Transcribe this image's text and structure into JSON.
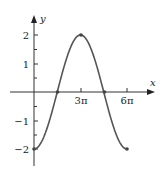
{
  "chart_data": {
    "type": "line",
    "title": "",
    "xlabel": "x",
    "ylabel": "y",
    "function": "y = -2cos(x/3)",
    "xlim": [
      0,
      6.2832
    ],
    "ylim": [
      -2,
      2
    ],
    "x_ticks": [
      {
        "value": 3,
        "label": "3π"
      },
      {
        "value": 6,
        "label": "6π"
      }
    ],
    "x_ticks_units": "multiples of π",
    "y_ticks": [
      {
        "value": 2,
        "label": "2"
      },
      {
        "value": 1,
        "label": "1"
      },
      {
        "value": -1,
        "label": "-1"
      },
      {
        "value": -2,
        "label": "-2"
      }
    ],
    "y_minor_ticks": [
      1.5,
      0.5,
      -0.5,
      -1.5
    ],
    "points": [
      {
        "x": "0",
        "y": -2
      },
      {
        "x": "3π/2",
        "y": 0
      },
      {
        "x": "3π",
        "y": 2
      },
      {
        "x": "9π/2",
        "y": 0
      },
      {
        "x": "6π",
        "y": -2
      }
    ],
    "series": [
      {
        "name": "y = -2cos(x/3)",
        "x_in_pi": [
          0,
          0.5,
          1,
          1.5,
          2,
          2.5,
          3,
          3.5,
          4,
          4.5,
          5,
          5.5,
          6
        ],
        "values": [
          -2,
          -1.932,
          -1.732,
          -1.414,
          -1,
          -0.518,
          0,
          0.518,
          1,
          1.414,
          1.732,
          1.932,
          2
        ]
      }
    ],
    "grid": false,
    "legend": null,
    "color": "#555555"
  },
  "labels": {
    "x_axis": "x",
    "y_axis": "y",
    "tick_3pi": "3π",
    "tick_6pi": "6π",
    "tick_y2": "2",
    "tick_y1": "1",
    "tick_ym1": "−1",
    "tick_ym2": "−2"
  }
}
